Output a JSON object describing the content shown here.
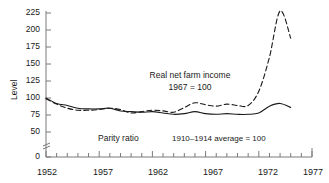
{
  "chart_data": {
    "type": "line",
    "title": "",
    "xlabel": "",
    "ylabel": "Level",
    "xlim": [
      1952,
      1977
    ],
    "ylim": [
      50,
      225
    ],
    "axis_break": {
      "present": true,
      "below": 50,
      "zero_shown": 0
    },
    "yticks": [
      0,
      50,
      75,
      100,
      125,
      150,
      175,
      200,
      225
    ],
    "ytick_labels": [
      "0",
      "50",
      "75",
      "100",
      "125",
      "150",
      "175",
      "200",
      "225"
    ],
    "xticks_major": [
      1952,
      1957,
      1962,
      1967,
      1972,
      1977
    ],
    "xtick_labels": [
      "1952",
      "1957",
      "1962",
      "1967",
      "1972",
      "1977"
    ],
    "xticks_minor_every": 1,
    "grid": false,
    "legend": "none (inline annotations)",
    "series": [
      {
        "name": "Real net farm income",
        "style": "dashed",
        "note": "1967 = 100",
        "x": [
          1952,
          1953,
          1954,
          1955,
          1956,
          1957,
          1958,
          1959,
          1960,
          1961,
          1962,
          1963,
          1964,
          1965,
          1966,
          1967,
          1968,
          1969,
          1970,
          1971,
          1972,
          1973,
          1974,
          1975
        ],
        "values": [
          99,
          91,
          85,
          82,
          82,
          83,
          85,
          83,
          78,
          80,
          82,
          81,
          79,
          86,
          93,
          90,
          88,
          91,
          89,
          89,
          110,
          160,
          228,
          188
        ]
      },
      {
        "name": "Parity ratio",
        "style": "solid",
        "note": "1910-1914 average = 100",
        "x": [
          1952,
          1953,
          1954,
          1955,
          1956,
          1957,
          1958,
          1959,
          1960,
          1961,
          1962,
          1963,
          1964,
          1965,
          1966,
          1967,
          1968,
          1969,
          1970,
          1971,
          1972,
          1973,
          1974,
          1975
        ],
        "values": [
          100,
          92,
          89,
          85,
          84,
          84,
          85,
          81,
          80,
          79,
          80,
          78,
          76,
          77,
          80,
          77,
          76,
          77,
          76,
          76,
          78,
          88,
          92,
          86
        ]
      }
    ],
    "annotations": [
      {
        "name": "real-net-farm-income-label",
        "line1": "Real net farm income",
        "line2": "1967 = 100"
      },
      {
        "name": "parity-ratio-label",
        "text": "Parity ratio"
      },
      {
        "name": "base-period-label",
        "text": "1910–1914 average = 100"
      }
    ],
    "colors": {
      "line": "#1a1a1a",
      "axis": "#808080",
      "text": "#1a1a1a",
      "background": "#ffffff"
    }
  }
}
